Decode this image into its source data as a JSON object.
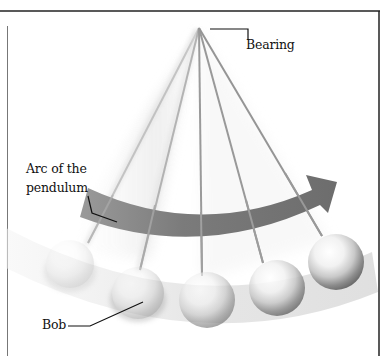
{
  "diagram": {
    "labels": {
      "bearing": "Bearing",
      "arc_line1": "Arc of the",
      "arc_line2": "pendulum",
      "bob": "Bob"
    },
    "colors": {
      "frame": "#222222",
      "string": "#9a9a9a",
      "arc_arrow": "#7d7d7d",
      "arc_arrow_dark": "#6a6a6a",
      "swing_band": "#e6e6e6",
      "leader_line": "#111111"
    },
    "apex": [
      199,
      28
    ],
    "pendulum_positions": [
      {
        "string_end": [
          88,
          243
        ],
        "bob_center": [
          70,
          264
        ],
        "bob_radius": 24,
        "opacity": 0.18
      },
      {
        "string_end": [
          140,
          270
        ],
        "bob_center": [
          138,
          293
        ],
        "bob_radius": 26,
        "opacity": 0.35
      },
      {
        "string_end": [
          202,
          276
        ],
        "bob_center": [
          207,
          300
        ],
        "bob_radius": 28,
        "opacity": 0.6
      },
      {
        "string_end": [
          263,
          263
        ],
        "bob_center": [
          277,
          288
        ],
        "bob_radius": 28,
        "opacity": 0.85
      },
      {
        "string_end": [
          322,
          236
        ],
        "bob_center": [
          336,
          262
        ],
        "bob_radius": 28,
        "opacity": 1.0
      }
    ]
  }
}
